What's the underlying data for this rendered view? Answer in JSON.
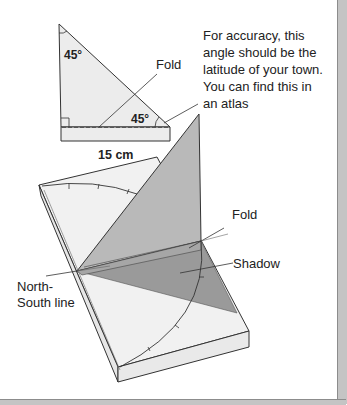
{
  "diagram": {
    "template_triangle": {
      "top_angle": "45°",
      "bottom_angle": "45°",
      "fold_label": "Fold",
      "width_label": "15 cm"
    },
    "note": {
      "lines": [
        "For accuracy, this",
        "angle should be the",
        "latitude of your town.",
        "You can find this in",
        "an atlas"
      ]
    },
    "assembled": {
      "fold_label": "Fold",
      "shadow_label": "Shadow",
      "north_south_label_line1": "North-",
      "north_south_label_line2": "South line"
    },
    "colors": {
      "paper_light": "#ececec",
      "gnomon": "#b9b9b9",
      "shadow": "#9a9a9a",
      "outline": "#333333",
      "frame_band": "#c4c4c4"
    }
  }
}
